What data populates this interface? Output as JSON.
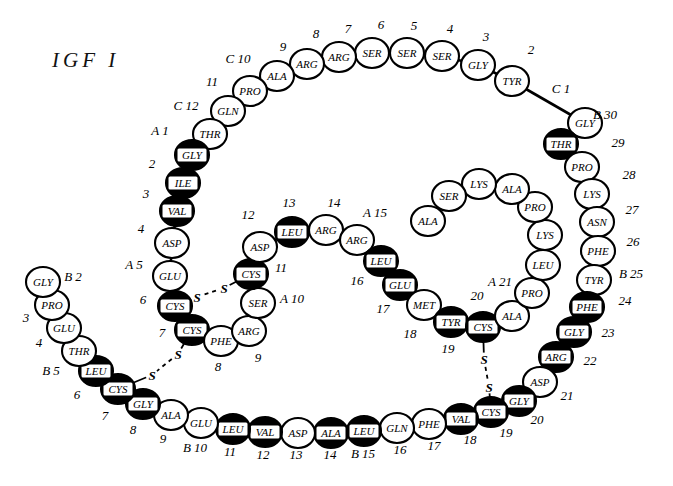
{
  "title": {
    "text": "IGF I",
    "x": 52,
    "y": 48
  },
  "style": {
    "filled_color": "#000000",
    "open_color": "#ffffff",
    "stroke_color": "#000000",
    "background": "#ffffff",
    "residue_rx": 17,
    "residue_ry": 15
  },
  "legend_note": "Filled (black) circles mark residues identical to insulin; open circles differ.",
  "chain_labels": [
    "A 1",
    "A 5",
    "A 10",
    "A 15",
    "A 21",
    "B 2",
    "B 5",
    "B 10",
    "B 15",
    "B 25",
    "B 30",
    "C 1",
    "C 10",
    "C 12"
  ],
  "residues": [
    {
      "id": "C1",
      "aa": "GLY",
      "num": "C 1",
      "filled": false,
      "x": 585,
      "y": 123,
      "lx": 561,
      "ly": 93,
      "lanchor": "middle"
    },
    {
      "id": "C2",
      "aa": "TYR",
      "num": "2",
      "filled": false,
      "x": 512,
      "y": 81,
      "lx": 531,
      "ly": 54,
      "lanchor": "middle"
    },
    {
      "id": "C3",
      "aa": "GLY",
      "num": "3",
      "filled": false,
      "x": 478,
      "y": 65,
      "lx": 486,
      "ly": 41,
      "lanchor": "middle"
    },
    {
      "id": "C4",
      "aa": "SER",
      "num": "4",
      "filled": false,
      "x": 442,
      "y": 56,
      "lx": 450,
      "ly": 33,
      "lanchor": "middle"
    },
    {
      "id": "C5",
      "aa": "SER",
      "num": "5",
      "filled": false,
      "x": 407,
      "y": 53,
      "lx": 414,
      "ly": 30,
      "lanchor": "middle"
    },
    {
      "id": "C6",
      "aa": "SER",
      "num": "6",
      "filled": false,
      "x": 372,
      "y": 53,
      "lx": 381,
      "ly": 29,
      "lanchor": "middle"
    },
    {
      "id": "C7",
      "aa": "ARG",
      "num": "7",
      "filled": false,
      "x": 339,
      "y": 57,
      "lx": 348,
      "ly": 33,
      "lanchor": "middle"
    },
    {
      "id": "C8",
      "aa": "ARG",
      "num": "8",
      "filled": false,
      "x": 307,
      "y": 64,
      "lx": 316,
      "ly": 38,
      "lanchor": "middle"
    },
    {
      "id": "C9",
      "aa": "ALA",
      "num": "9",
      "filled": false,
      "x": 277,
      "y": 76,
      "lx": 283,
      "ly": 51,
      "lanchor": "middle"
    },
    {
      "id": "C10",
      "aa": "PRO",
      "num": "C 10",
      "filled": false,
      "x": 250,
      "y": 91,
      "lx": 238,
      "ly": 63,
      "lanchor": "middle"
    },
    {
      "id": "C11",
      "aa": "GLN",
      "num": "11",
      "filled": false,
      "x": 228,
      "y": 111,
      "lx": 212,
      "ly": 86,
      "lanchor": "middle"
    },
    {
      "id": "C12",
      "aa": "THR",
      "num": "C 12",
      "filled": false,
      "x": 210,
      "y": 134,
      "lx": 186,
      "ly": 110,
      "lanchor": "middle"
    },
    {
      "id": "A1",
      "aa": "GLY",
      "num": "A 1",
      "filled": true,
      "x": 192,
      "y": 155,
      "lx": 160,
      "ly": 135,
      "lanchor": "middle"
    },
    {
      "id": "A2",
      "aa": "ILE",
      "num": "2",
      "filled": true,
      "x": 183,
      "y": 183,
      "lx": 152,
      "ly": 168,
      "lanchor": "middle"
    },
    {
      "id": "A3",
      "aa": "VAL",
      "num": "3",
      "filled": true,
      "x": 177,
      "y": 211,
      "lx": 146,
      "ly": 198,
      "lanchor": "middle"
    },
    {
      "id": "A4",
      "aa": "ASP",
      "num": "4",
      "filled": false,
      "x": 172,
      "y": 243,
      "lx": 141,
      "ly": 233,
      "lanchor": "middle"
    },
    {
      "id": "A5",
      "aa": "GLU",
      "num": "A 5",
      "filled": false,
      "x": 170,
      "y": 276,
      "lx": 134,
      "ly": 269,
      "lanchor": "middle"
    },
    {
      "id": "A6",
      "aa": "CYS",
      "num": "6",
      "filled": true,
      "x": 175,
      "y": 306,
      "lx": 143,
      "ly": 304,
      "lanchor": "middle"
    },
    {
      "id": "A7",
      "aa": "CYS",
      "num": "7",
      "filled": true,
      "x": 192,
      "y": 330,
      "lx": 162,
      "ly": 337,
      "lanchor": "middle"
    },
    {
      "id": "A8",
      "aa": "PHE",
      "num": "8",
      "filled": false,
      "x": 221,
      "y": 341,
      "lx": 218,
      "ly": 371,
      "lanchor": "middle"
    },
    {
      "id": "A9",
      "aa": "ARG",
      "num": "9",
      "filled": false,
      "x": 249,
      "y": 331,
      "lx": 258,
      "ly": 362,
      "lanchor": "middle"
    },
    {
      "id": "A10",
      "aa": "SER",
      "num": "A 10",
      "filled": false,
      "x": 258,
      "y": 303,
      "lx": 292,
      "ly": 303,
      "lanchor": "middle"
    },
    {
      "id": "A11",
      "aa": "CYS",
      "num": "11",
      "filled": true,
      "x": 251,
      "y": 274,
      "lx": 281,
      "ly": 272,
      "lanchor": "middle"
    },
    {
      "id": "A12",
      "aa": "ASP",
      "num": "12",
      "filled": false,
      "x": 260,
      "y": 247,
      "lx": 248,
      "ly": 219,
      "lanchor": "middle"
    },
    {
      "id": "A13",
      "aa": "LEU",
      "num": "13",
      "filled": true,
      "x": 292,
      "y": 232,
      "lx": 289,
      "ly": 207,
      "lanchor": "middle"
    },
    {
      "id": "A14",
      "aa": "ARG",
      "num": "14",
      "filled": false,
      "x": 326,
      "y": 230,
      "lx": 334,
      "ly": 207,
      "lanchor": "middle"
    },
    {
      "id": "A15",
      "aa": "ARG",
      "num": "A 15",
      "filled": false,
      "x": 357,
      "y": 240,
      "lx": 375,
      "ly": 217,
      "lanchor": "middle"
    },
    {
      "id": "A16",
      "aa": "LEU",
      "num": "16",
      "filled": true,
      "x": 381,
      "y": 261,
      "lx": 357,
      "ly": 285,
      "lanchor": "middle"
    },
    {
      "id": "A17",
      "aa": "GLU",
      "num": "17",
      "filled": true,
      "x": 400,
      "y": 285,
      "lx": 383,
      "ly": 313,
      "lanchor": "middle"
    },
    {
      "id": "A18",
      "aa": "MET",
      "num": "18",
      "filled": false,
      "x": 424,
      "y": 305,
      "lx": 410,
      "ly": 338,
      "lanchor": "middle"
    },
    {
      "id": "A19",
      "aa": "TYR",
      "num": "19",
      "filled": true,
      "x": 451,
      "y": 322,
      "lx": 448,
      "ly": 353,
      "lanchor": "middle"
    },
    {
      "id": "A20",
      "aa": "CYS",
      "num": "20",
      "filled": true,
      "x": 483,
      "y": 327,
      "lx": 477,
      "ly": 300,
      "lanchor": "middle"
    },
    {
      "id": "A21",
      "aa": "ALA",
      "num": "A 21",
      "filled": false,
      "x": 512,
      "y": 316,
      "lx": 500,
      "ly": 286,
      "lanchor": "middle"
    },
    {
      "id": "D1",
      "aa": "PRO",
      "num": "",
      "filled": false,
      "x": 532,
      "y": 293,
      "lx": 0,
      "ly": 0,
      "lanchor": "middle"
    },
    {
      "id": "D2",
      "aa": "LEU",
      "num": "",
      "filled": false,
      "x": 543,
      "y": 265,
      "lx": 0,
      "ly": 0,
      "lanchor": "middle"
    },
    {
      "id": "D3",
      "aa": "LYS",
      "num": "",
      "filled": false,
      "x": 545,
      "y": 235,
      "lx": 0,
      "ly": 0,
      "lanchor": "middle"
    },
    {
      "id": "D4",
      "aa": "PRO",
      "num": "",
      "filled": false,
      "x": 535,
      "y": 207,
      "lx": 0,
      "ly": 0,
      "lanchor": "middle"
    },
    {
      "id": "D5",
      "aa": "ALA",
      "num": "",
      "filled": false,
      "x": 512,
      "y": 189,
      "lx": 0,
      "ly": 0,
      "lanchor": "middle"
    },
    {
      "id": "D6",
      "aa": "LYS",
      "num": "",
      "filled": false,
      "x": 479,
      "y": 184,
      "lx": 0,
      "ly": 0,
      "lanchor": "middle"
    },
    {
      "id": "D7",
      "aa": "SER",
      "num": "",
      "filled": false,
      "x": 449,
      "y": 196,
      "lx": 0,
      "ly": 0,
      "lanchor": "middle"
    },
    {
      "id": "D8",
      "aa": "ALA",
      "num": "",
      "filled": false,
      "x": 428,
      "y": 221,
      "lx": 0,
      "ly": 0,
      "lanchor": "middle"
    },
    {
      "id": "B30",
      "aa": "THR",
      "num": "B 30",
      "filled": true,
      "x": 561,
      "y": 144,
      "lx": 605,
      "ly": 119,
      "lanchor": "middle"
    },
    {
      "id": "B29",
      "aa": "PRO",
      "num": "29",
      "filled": false,
      "x": 582,
      "y": 167,
      "lx": 618,
      "ly": 147,
      "lanchor": "middle"
    },
    {
      "id": "B28",
      "aa": "LYS",
      "num": "28",
      "filled": false,
      "x": 592,
      "y": 194,
      "lx": 629,
      "ly": 179,
      "lanchor": "middle"
    },
    {
      "id": "B27",
      "aa": "ASN",
      "num": "27",
      "filled": false,
      "x": 597,
      "y": 222,
      "lx": 632,
      "ly": 214,
      "lanchor": "middle"
    },
    {
      "id": "B26",
      "aa": "PHE",
      "num": "26",
      "filled": false,
      "x": 598,
      "y": 251,
      "lx": 633,
      "ly": 246,
      "lanchor": "middle"
    },
    {
      "id": "B25",
      "aa": "TYR",
      "num": "B 25",
      "filled": false,
      "x": 594,
      "y": 280,
      "lx": 631,
      "ly": 278,
      "lanchor": "middle"
    },
    {
      "id": "B24",
      "aa": "PHE",
      "num": "24",
      "filled": true,
      "x": 587,
      "y": 307,
      "lx": 625,
      "ly": 305,
      "lanchor": "middle"
    },
    {
      "id": "B23",
      "aa": "GLY",
      "num": "23",
      "filled": true,
      "x": 574,
      "y": 332,
      "lx": 608,
      "ly": 337,
      "lanchor": "middle"
    },
    {
      "id": "B22",
      "aa": "ARG",
      "num": "22",
      "filled": true,
      "x": 556,
      "y": 357,
      "lx": 590,
      "ly": 365,
      "lanchor": "middle"
    },
    {
      "id": "B21",
      "aa": "ASP",
      "num": "21",
      "filled": false,
      "x": 540,
      "y": 382,
      "lx": 567,
      "ly": 400,
      "lanchor": "middle"
    },
    {
      "id": "B20",
      "aa": "GLY",
      "num": "20",
      "filled": true,
      "x": 519,
      "y": 401,
      "lx": 537,
      "ly": 424,
      "lanchor": "middle"
    },
    {
      "id": "B19",
      "aa": "CYS",
      "num": "19",
      "filled": true,
      "x": 491,
      "y": 412,
      "lx": 506,
      "ly": 437,
      "lanchor": "middle"
    },
    {
      "id": "B18",
      "aa": "VAL",
      "num": "18",
      "filled": true,
      "x": 461,
      "y": 419,
      "lx": 470,
      "ly": 444,
      "lanchor": "middle"
    },
    {
      "id": "B17",
      "aa": "PHE",
      "num": "17",
      "filled": false,
      "x": 429,
      "y": 424,
      "lx": 434,
      "ly": 450,
      "lanchor": "middle"
    },
    {
      "id": "B16",
      "aa": "GLN",
      "num": "16",
      "filled": false,
      "x": 397,
      "y": 428,
      "lx": 400,
      "ly": 454,
      "lanchor": "middle"
    },
    {
      "id": "B15",
      "aa": "LEU",
      "num": "B 15",
      "filled": true,
      "x": 364,
      "y": 431,
      "lx": 363,
      "ly": 458,
      "lanchor": "middle"
    },
    {
      "id": "B14",
      "aa": "ALA",
      "num": "14",
      "filled": true,
      "x": 331,
      "y": 433,
      "lx": 330,
      "ly": 459,
      "lanchor": "middle"
    },
    {
      "id": "B13",
      "aa": "ASP",
      "num": "13",
      "filled": false,
      "x": 298,
      "y": 433,
      "lx": 296,
      "ly": 459,
      "lanchor": "middle"
    },
    {
      "id": "B12",
      "aa": "VAL",
      "num": "12",
      "filled": true,
      "x": 265,
      "y": 432,
      "lx": 263,
      "ly": 459,
      "lanchor": "middle"
    },
    {
      "id": "B11",
      "aa": "LEU",
      "num": "11",
      "filled": true,
      "x": 233,
      "y": 429,
      "lx": 230,
      "ly": 456,
      "lanchor": "middle"
    },
    {
      "id": "B10",
      "aa": "GLU",
      "num": "B 10",
      "filled": false,
      "x": 201,
      "y": 423,
      "lx": 195,
      "ly": 452,
      "lanchor": "middle"
    },
    {
      "id": "B9",
      "aa": "ALA",
      "num": "9",
      "filled": false,
      "x": 171,
      "y": 415,
      "lx": 163,
      "ly": 443,
      "lanchor": "middle"
    },
    {
      "id": "B8",
      "aa": "GLY",
      "num": "8",
      "filled": true,
      "x": 143,
      "y": 404,
      "lx": 133,
      "ly": 434,
      "lanchor": "middle"
    },
    {
      "id": "B7",
      "aa": "CYS",
      "num": "7",
      "filled": true,
      "x": 118,
      "y": 389,
      "lx": 105,
      "ly": 420,
      "lanchor": "middle"
    },
    {
      "id": "B6",
      "aa": "LEU",
      "num": "6",
      "filled": true,
      "x": 96,
      "y": 371,
      "lx": 77,
      "ly": 399,
      "lanchor": "middle"
    },
    {
      "id": "B5",
      "aa": "THR",
      "num": "B 5",
      "filled": false,
      "x": 79,
      "y": 351,
      "lx": 51,
      "ly": 375,
      "lanchor": "middle"
    },
    {
      "id": "B4",
      "aa": "GLU",
      "num": "4",
      "filled": false,
      "x": 64,
      "y": 328,
      "lx": 39,
      "ly": 347,
      "lanchor": "middle"
    },
    {
      "id": "B3",
      "aa": "PRO",
      "num": "3",
      "filled": false,
      "x": 52,
      "y": 305,
      "lx": 26,
      "ly": 322,
      "lanchor": "middle"
    },
    {
      "id": "B2",
      "aa": "GLY",
      "num": "B 2",
      "filled": false,
      "x": 43,
      "y": 282,
      "lx": 73,
      "ly": 281,
      "lanchor": "middle"
    }
  ],
  "backbone_chains": [
    [
      "C1",
      "C2",
      "C3",
      "C4",
      "C5",
      "C6",
      "C7",
      "C8",
      "C9",
      "C10",
      "C11",
      "C12",
      "A1",
      "A2",
      "A3",
      "A4",
      "A5",
      "A6",
      "A7",
      "A8",
      "A9",
      "A10",
      "A11",
      "A12",
      "A13",
      "A14",
      "A15",
      "A16",
      "A17",
      "A18",
      "A19",
      "A20",
      "A21",
      "D1",
      "D2",
      "D3",
      "D4",
      "D5",
      "D6",
      "D7",
      "D8"
    ],
    [
      "B30",
      "B29",
      "B28",
      "B27",
      "B26",
      "B25",
      "B24",
      "B23",
      "B22",
      "B21",
      "B20",
      "B19",
      "B18",
      "B17",
      "B16",
      "B15",
      "B14",
      "B13",
      "B12",
      "B11",
      "B10",
      "B9",
      "B8",
      "B7",
      "B6",
      "B5",
      "B4",
      "B3",
      "B2"
    ]
  ],
  "backbone_gaps": [
    [
      "A21",
      "D1"
    ],
    [
      "D8",
      "A21"
    ]
  ],
  "disulfides": [
    {
      "name": "A6-A11",
      "from": "A6",
      "to": "A11",
      "label": "S",
      "s1x": 197,
      "s1y": 297,
      "s2x": 224,
      "s2y": 288
    },
    {
      "name": "A7-B7",
      "from": "A7",
      "to": "B7",
      "label": "S",
      "s1x": 178,
      "s1y": 354,
      "s2x": 152,
      "s2y": 375
    },
    {
      "name": "A20-B19",
      "from": "A20",
      "to": "B19",
      "label": "S",
      "s1x": 484,
      "s1y": 359,
      "s2x": 489,
      "s2y": 387
    }
  ],
  "junction_links": [
    {
      "name": "C1-B30",
      "from": "C1",
      "to": "B30"
    }
  ]
}
